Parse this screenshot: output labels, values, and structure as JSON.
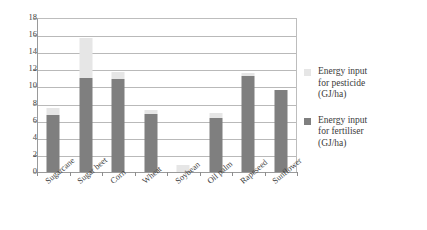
{
  "chart_data": {
    "type": "bar",
    "stacked": true,
    "title": "",
    "xlabel": "",
    "ylabel": "",
    "ylim": [
      0,
      18
    ],
    "ytick_step": 2,
    "yticks": [
      "18",
      "16",
      "14",
      "12",
      "10",
      "8",
      "6",
      "4",
      "2",
      "0"
    ],
    "grid": true,
    "legend_position": "right",
    "categories": [
      "Sugarcane",
      "Sugar beet",
      "Corn",
      "Wheat",
      "Soybean",
      "Oil palm",
      "Rapeseed",
      "Sunflower"
    ],
    "series": [
      {
        "name": "Energy input for fertiliser (GJ/ha)",
        "color": "#7f7f7f",
        "values": [
          6.7,
          11.0,
          10.9,
          6.8,
          0.0,
          6.3,
          11.2,
          9.6
        ]
      },
      {
        "name": "Energy input for pesticide (GJ/ha)",
        "color": "#e6e6e6",
        "values": [
          0.8,
          4.7,
          0.8,
          0.4,
          0.8,
          0.6,
          0.4,
          0.0
        ]
      }
    ],
    "totals": [
      7.5,
      15.7,
      11.7,
      7.2,
      0.8,
      6.9,
      11.6,
      9.6
    ]
  },
  "legend": {
    "items": [
      {
        "label": "Energy input for pesticide (GJ/ha)",
        "line1": "Energy input",
        "line2": "for pesticide",
        "line3": "(GJ/ha)",
        "color": "#e6e6e6"
      },
      {
        "label": "Energy input for fertiliser (GJ/ha)",
        "line1": "Energy input",
        "line2": "for fertiliser",
        "line3": "(GJ/ha)",
        "color": "#7f7f7f"
      }
    ]
  }
}
